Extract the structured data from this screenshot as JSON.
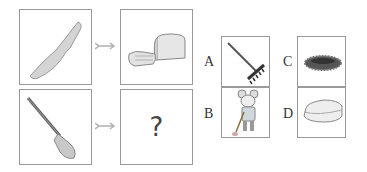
{
  "puzzle": {
    "row1": {
      "left": "knife",
      "right": "sliced-bread"
    },
    "row2": {
      "left": "shovel",
      "right": "?"
    },
    "question_mark": "?"
  },
  "options": [
    {
      "label": "A",
      "image": "rake"
    },
    {
      "label": "B",
      "image": "mouse-sweeping"
    },
    {
      "label": "C",
      "image": "nest"
    },
    {
      "label": "D",
      "image": "sandwich"
    }
  ]
}
